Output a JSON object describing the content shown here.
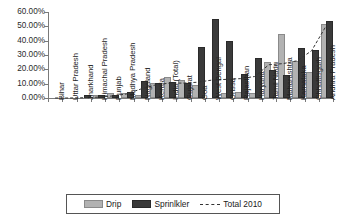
{
  "chart_data": {
    "type": "bar",
    "title": "",
    "xlabel": "",
    "ylabel": "",
    "ylim": [
      0,
      0.6
    ],
    "grid": false,
    "legend_position": "bottom",
    "ytick_labels": [
      "60.00%",
      "50.00%",
      "40.00%",
      "30.00%",
      "20.00%",
      "10.00%",
      "0.00%"
    ],
    "ytick_values": [
      0.6,
      0.5,
      0.4,
      0.3,
      0.2,
      0.1,
      0.0
    ],
    "categories": [
      "Bihar",
      "Uttar Pradesh",
      "Jharkhand",
      "Himachal Pradesh",
      "Punjab",
      "Madhya Pradesh",
      "Nagaland",
      "Kerala",
      "India (Total)",
      "Gujarat",
      "Goa",
      "West Bengal",
      "Orissa",
      "Rajasthan",
      "Haryana",
      "Tamil Nadu",
      "Maharashtra",
      "Karnataka",
      "Chhattisgarh",
      "Andhra Pradesh"
    ],
    "series": [
      {
        "name": "Drip",
        "color": "#b2b2b2",
        "values": [
          0.0,
          0.0,
          0.0,
          0.002,
          0.018,
          0.022,
          0.005,
          0.088,
          0.134,
          0.112,
          0.08,
          0.0,
          0.024,
          0.028,
          0.018,
          0.24,
          0.435,
          0.245,
          0.17,
          0.5
        ]
      },
      {
        "name": "Sprinlkler",
        "color": "#3a3a3a",
        "values": [
          0.0,
          0.0,
          0.002,
          0.004,
          0.01,
          0.028,
          0.108,
          0.09,
          0.1,
          0.093,
          0.34,
          0.538,
          0.382,
          0.152,
          0.262,
          0.182,
          0.145,
          0.332,
          0.32,
          0.525
        ]
      }
    ],
    "trend": {
      "name": "Total 2010",
      "style": "dashed",
      "color": "#333333",
      "values": [
        0.0,
        0.0,
        0.002,
        0.006,
        0.014,
        0.028,
        0.062,
        0.09,
        0.104,
        0.104,
        0.11,
        0.125,
        0.13,
        0.135,
        0.15,
        0.232,
        0.24,
        0.26,
        0.33,
        0.5
      ]
    }
  },
  "legend": {
    "drip_label": "Drip",
    "sprinkler_label": "Sprinlkler",
    "total_label": "Total 2010"
  }
}
